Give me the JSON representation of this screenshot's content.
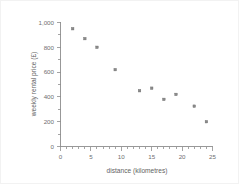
{
  "chart_data": {
    "type": "scatter",
    "title": "",
    "xlabel": "distance (kilometres)",
    "ylabel": "weekly rental price (£)",
    "xlim": [
      0,
      25
    ],
    "ylim": [
      0,
      1000
    ],
    "grid": false,
    "legend": null,
    "xticks": [
      "0",
      "5",
      "10",
      "15",
      "20",
      "25"
    ],
    "xtick_values": [
      0,
      5,
      10,
      15,
      20,
      25
    ],
    "yticks": [
      "0",
      "200",
      "400",
      "600",
      "800",
      "1,000"
    ],
    "ytick_values": [
      0,
      200,
      400,
      600,
      800,
      1000
    ],
    "x": [
      2,
      4,
      6,
      9,
      13,
      15,
      17,
      19,
      22,
      24
    ],
    "y": [
      950,
      870,
      800,
      620,
      450,
      470,
      380,
      420,
      325,
      200
    ],
    "points": [
      {
        "x": 2,
        "y": 950
      },
      {
        "x": 4,
        "y": 870
      },
      {
        "x": 6,
        "y": 800
      },
      {
        "x": 9,
        "y": 620
      },
      {
        "x": 13,
        "y": 450
      },
      {
        "x": 15,
        "y": 470
      },
      {
        "x": 17,
        "y": 380
      },
      {
        "x": 19,
        "y": 420
      },
      {
        "x": 22,
        "y": 325
      },
      {
        "x": 24,
        "y": 200
      }
    ],
    "marker": "square",
    "marker_color": "#8a8a8a",
    "axis_color": "#8d8d8d",
    "text_color": "#6f6f6f",
    "background": "#ffffff"
  }
}
